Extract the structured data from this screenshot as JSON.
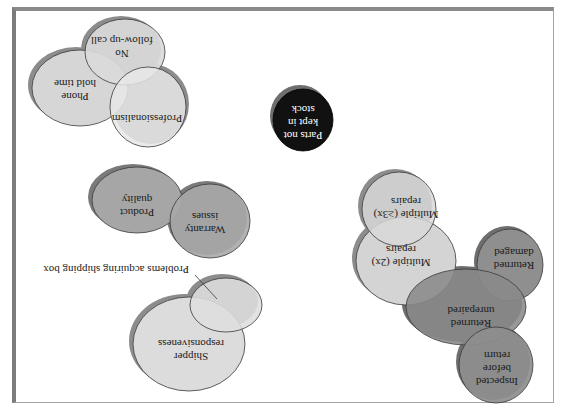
{
  "diagram": {
    "orientation": "rotated-180",
    "colors": {
      "frame_border": "#8a8a8a",
      "background": "#ffffff",
      "light_fill": "#dcdcdc",
      "lighter_fill": "#e6e6e6",
      "medium_fill": "#a9a9a9",
      "dark_fill": "#8e8e8e",
      "black_fill": "#111111",
      "shadow": "#8c8c8c",
      "outline": "#3a3a3a"
    },
    "clusters": [
      {
        "name": "customer-service",
        "bubbles": [
          {
            "id": "no-follow-up",
            "lines": [
              "No",
              "follow-up call"
            ]
          },
          {
            "id": "phone-hold-time",
            "lines": [
              "Phone",
              "hold time"
            ]
          },
          {
            "id": "professionalism",
            "lines": [
              "Professionalism"
            ]
          }
        ]
      },
      {
        "name": "parts",
        "bubbles": [
          {
            "id": "parts-not-kept",
            "lines": [
              "Parts not",
              "kept in",
              "stock"
            ]
          }
        ]
      },
      {
        "name": "product",
        "bubbles": [
          {
            "id": "product-quality",
            "lines": [
              "Product",
              "quality"
            ]
          },
          {
            "id": "warranty-issues",
            "lines": [
              "Warranty",
              "issues"
            ]
          }
        ]
      },
      {
        "name": "shipping",
        "bubbles": [
          {
            "id": "problems-shipping-box",
            "lines": []
          },
          {
            "id": "shipper-responsiveness",
            "lines": [
              "Shipper",
              "responsiveness"
            ]
          }
        ],
        "callout": "Problems acquiring shipping box"
      },
      {
        "name": "repairs",
        "bubbles": [
          {
            "id": "multiple-3x",
            "lines": [
              "Multiple (≥3x)",
              "repairs"
            ]
          },
          {
            "id": "multiple-2x",
            "lines": [
              "Multiple (2x)",
              "repairs"
            ]
          },
          {
            "id": "returned-damaged",
            "lines": [
              "Returned",
              "damaged"
            ]
          },
          {
            "id": "returned-unrepaired",
            "lines": [
              "Returned",
              "unrepaired"
            ]
          },
          {
            "id": "inspected-before-return",
            "lines": [
              "Inspected",
              "before",
              "return"
            ]
          }
        ]
      }
    ]
  }
}
